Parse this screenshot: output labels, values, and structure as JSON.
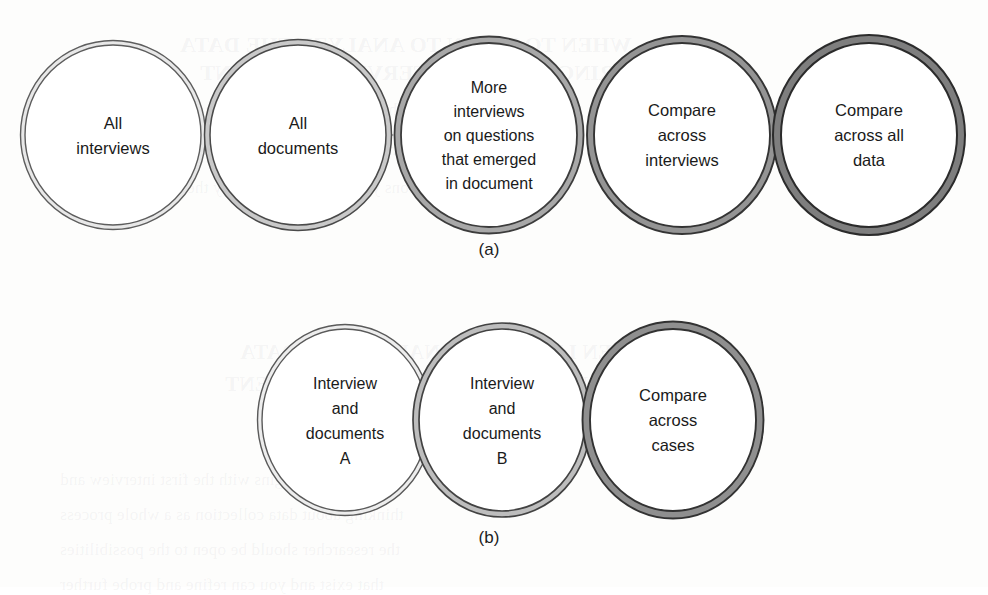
{
  "figure": {
    "kind": "process-flow-diagram",
    "background_color": "#fdfdfc",
    "panels": [
      {
        "id": "panel-a",
        "label": "(a)",
        "label_x": 489,
        "label_y": 255,
        "nodes": [
          {
            "id": "a1",
            "lines": [
              "All",
              "interviews"
            ],
            "cx": 113,
            "cy": 135,
            "rx": 88,
            "ry": 90,
            "outline_color": "#5d5d5d",
            "band_color": "#e8e8e8",
            "outline_width": 1.4,
            "band_width": 4.5
          },
          {
            "id": "a2",
            "lines": [
              "All",
              "documents"
            ],
            "cx": 298,
            "cy": 135,
            "rx": 88,
            "ry": 90,
            "outline_color": "#4a4a4a",
            "band_color": "#c9c9c9",
            "outline_width": 1.5,
            "band_width": 5.5
          },
          {
            "id": "a3",
            "lines": [
              "More",
              "interviews",
              "on questions",
              "that emerged",
              "in document"
            ],
            "cx": 489,
            "cy": 135,
            "rx": 88,
            "ry": 92,
            "outline_color": "#3c3c3c",
            "band_color": "#a8a8a8",
            "outline_width": 1.8,
            "band_width": 6.5
          },
          {
            "id": "a4",
            "lines": [
              "Compare",
              "across",
              "interviews"
            ],
            "cx": 682,
            "cy": 135,
            "rx": 88,
            "ry": 92,
            "outline_color": "#343434",
            "band_color": "#949494",
            "outline_width": 1.9,
            "band_width": 7
          },
          {
            "id": "a5",
            "lines": [
              "Compare",
              "across all",
              "data"
            ],
            "cx": 869,
            "cy": 135,
            "rx": 88,
            "ry": 92,
            "outline_color": "#2b2b2b",
            "band_color": "#7e7e7e",
            "outline_width": 2.0,
            "band_width": 8
          }
        ],
        "arrows": [
          {
            "id": "a-arrow-1",
            "x": 178,
            "y": 135,
            "w": 58,
            "h": 96,
            "fill": "#e6e6e6",
            "stroke": "#c4c4c4"
          },
          {
            "id": "a-arrow-2",
            "x": 362,
            "y": 135,
            "w": 62,
            "h": 100,
            "fill": "#cacaca",
            "stroke": "#9a9a9a"
          },
          {
            "id": "a-arrow-3",
            "x": 552,
            "y": 135,
            "w": 62,
            "h": 100,
            "fill": "#a6a6a6",
            "stroke": "#7e7e7e"
          },
          {
            "id": "a-arrow-4",
            "x": 744,
            "y": 135,
            "w": 62,
            "h": 100,
            "fill": "#8c8c8c",
            "stroke": "#626262"
          }
        ]
      },
      {
        "id": "panel-b",
        "label": "(b)",
        "label_x": 489,
        "label_y": 543,
        "nodes": [
          {
            "id": "b1",
            "lines": [
              "Interview",
              "and",
              "documents",
              "A"
            ],
            "cx": 345,
            "cy": 420,
            "rx": 83,
            "ry": 91,
            "outline_color": "#5a5a5a",
            "band_color": "#ededed",
            "outline_width": 1.4,
            "band_width": 4.5
          },
          {
            "id": "b2",
            "lines": [
              "Interview",
              "and",
              "documents",
              "B"
            ],
            "cx": 502,
            "cy": 420,
            "rx": 83,
            "ry": 91,
            "outline_color": "#424242",
            "band_color": "#bdbdbd",
            "outline_width": 1.7,
            "band_width": 6
          },
          {
            "id": "b3",
            "lines": [
              "Compare",
              "across",
              "cases"
            ],
            "cx": 673,
            "cy": 420,
            "rx": 83,
            "ry": 91,
            "outline_color": "#323232",
            "band_color": "#8f8f8f",
            "outline_width": 1.9,
            "band_width": 7.5
          }
        ],
        "arrows": [
          {
            "id": "b-arrow-1",
            "x": 415,
            "y": 420,
            "w": 56,
            "h": 96,
            "fill": "#e3e3e3",
            "stroke": "#bcbcbc"
          },
          {
            "id": "b-arrow-2",
            "x": 578,
            "y": 420,
            "w": 56,
            "h": 96,
            "fill": "#cbcbcb",
            "stroke": "#9e9e9e"
          }
        ]
      }
    ],
    "background_ghost_text": [
      {
        "text": "WHEN TO BEGIN TO ANALYZE THE DATA",
        "x": 180,
        "y": 32,
        "size": 22,
        "weight": "bold"
      },
      {
        "text": "DURING A GIVEN INTERVIEW OR EVENT",
        "x": 200,
        "y": 60,
        "size": 22,
        "weight": "bold"
      },
      {
        "text": "the researcher may be able to pursue a topic as it emerges",
        "x": 70,
        "y": 100,
        "size": 17,
        "weight": "normal"
      },
      {
        "text": "appears that the topic is important you will also want to",
        "x": 70,
        "y": 140,
        "size": 17,
        "weight": "normal"
      },
      {
        "text": "questions you want to help clarify the issue as it arises",
        "x": 70,
        "y": 178,
        "size": 17,
        "weight": "normal"
      },
      {
        "text": "WHEN I BEGIN TO ANALYZE THE DATA",
        "x": 240,
        "y": 340,
        "size": 21,
        "weight": "bold"
      },
      {
        "text": "DURING A GIVEN INTERVIEW OR EVENT",
        "x": 225,
        "y": 372,
        "size": 21,
        "weight": "bold"
      },
      {
        "text": "research begins with the first interview and",
        "x": 60,
        "y": 470,
        "size": 17,
        "weight": "normal"
      },
      {
        "text": "thinking about data collection as a whole process",
        "x": 60,
        "y": 505,
        "size": 17,
        "weight": "normal"
      },
      {
        "text": "the researcher should be open to the possibilities",
        "x": 60,
        "y": 540,
        "size": 17,
        "weight": "normal"
      },
      {
        "text": "that exist and you can refine and probe further",
        "x": 60,
        "y": 575,
        "size": 17,
        "weight": "normal"
      }
    ]
  }
}
